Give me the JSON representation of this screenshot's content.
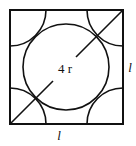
{
  "diagram": {
    "center_label": "4 r",
    "side_label_right": "l",
    "side_label_bottom": "l",
    "stroke_color": "#111111",
    "background": "#ffffff"
  }
}
